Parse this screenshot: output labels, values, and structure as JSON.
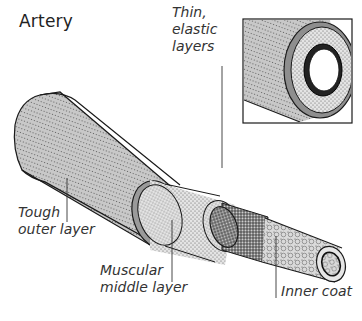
{
  "title": "Artery",
  "labels": {
    "elastic": [
      "Thin,",
      "elastic",
      "layers"
    ],
    "outer": [
      "Tough",
      "outer layer"
    ],
    "middle": [
      "Muscular",
      "middle layer"
    ],
    "inner": [
      "Inner coat"
    ]
  },
  "colors": {
    "outline": "#1a1a1a",
    "outer_fill": "#c8c8c8",
    "middle_fill": "#e2e2e2",
    "elastic_fill": "#9a9a9a",
    "inner_fill": "#d6d6d6",
    "label_text": "#333333"
  }
}
